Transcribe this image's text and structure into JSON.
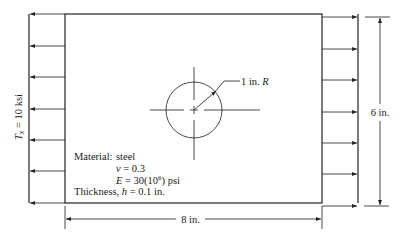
{
  "diagram": {
    "type": "plate-with-hole-under-tension",
    "traction_label": {
      "symbol": "T",
      "subscript": "x",
      "rest": " = 10 ksi"
    },
    "hole_label": {
      "value": "1 in. ",
      "symbol": "R"
    },
    "width_label": "8 in.",
    "height_label": "6 in.",
    "material": {
      "line1_label": "Material:",
      "line1_value": "steel",
      "nu_symbol": "ν",
      "nu_rest": " = 0.3",
      "E_symbol": "E",
      "E_rest_a": " = 30(10",
      "E_exp": "6",
      "E_rest_b": ") psi",
      "thickness_a": "Thickness, ",
      "thickness_symbol": "h",
      "thickness_b": " = 0.1 in."
    },
    "load_arrow_count": 7,
    "colors": {
      "line": "#222222",
      "background": "#ffffff"
    }
  }
}
